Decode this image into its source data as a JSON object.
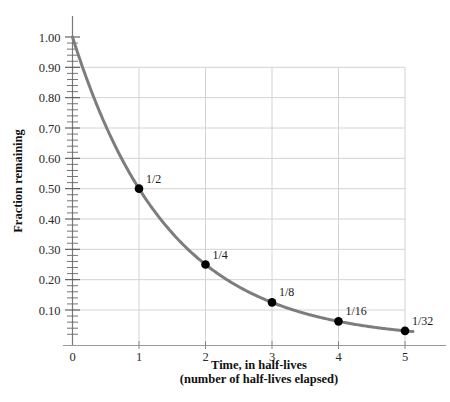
{
  "chart_data": {
    "type": "line",
    "title": "",
    "xlabel": "Time, in half-lives",
    "xlabel_sub": "(number of half-lives elapsed)",
    "ylabel": "Fraction remaining",
    "xlim": [
      0,
      5.3
    ],
    "ylim": [
      0,
      1.05
    ],
    "grid": true,
    "legend": "none",
    "curve_color": "#7d7d7d",
    "point_color": "#000000",
    "grid_color": "#cfcfcf",
    "axis_color": "#8a8a8a",
    "x_ticks": [
      "0",
      "1",
      "2",
      "3",
      "4",
      "5"
    ],
    "x_tick_values": [
      0,
      1,
      2,
      3,
      4,
      5
    ],
    "y_ticks": [
      "0.10",
      "0.20",
      "0.30",
      "0.40",
      "0.50",
      "0.60",
      "0.70",
      "0.80",
      "0.90",
      "1.00"
    ],
    "y_tick_values": [
      0.1,
      0.2,
      0.3,
      0.4,
      0.5,
      0.6,
      0.7,
      0.8,
      0.9,
      1.0
    ],
    "y_minor_per_major": 5,
    "x": [
      0,
      1,
      2,
      3,
      4,
      5
    ],
    "values": [
      1,
      0.5,
      0.25,
      0.125,
      0.0625,
      0.03125
    ],
    "series": [
      {
        "name": "Fraction remaining",
        "x": [
          0,
          1,
          2,
          3,
          4,
          5
        ],
        "values": [
          1,
          0.5,
          0.25,
          0.125,
          0.0625,
          0.03125
        ]
      }
    ],
    "points": [
      {
        "x": 1,
        "y": 0.5,
        "label": "1/2"
      },
      {
        "x": 2,
        "y": 0.25,
        "label": "1/4"
      },
      {
        "x": 3,
        "y": 0.125,
        "label": "1/8"
      },
      {
        "x": 4,
        "y": 0.0625,
        "label": "1/16"
      },
      {
        "x": 5,
        "y": 0.03125,
        "label": "1/32"
      }
    ],
    "annotations": [
      "1/2",
      "1/4",
      "1/8",
      "1/16",
      "1/32"
    ]
  }
}
